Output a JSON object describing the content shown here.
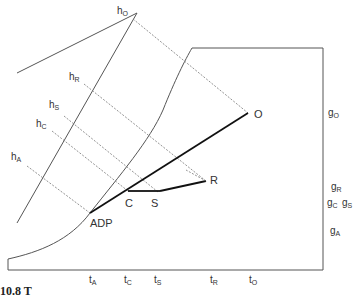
{
  "diagram": {
    "type": "psychrometric-process-diagram",
    "points": {
      "ADP": {
        "label": "ADP"
      },
      "C": {
        "label": "C"
      },
      "S": {
        "label": "S"
      },
      "R": {
        "label": "R"
      },
      "O": {
        "label": "O"
      }
    },
    "enthalpy_labels": [
      {
        "main": "h",
        "sub": "O"
      },
      {
        "main": "h",
        "sub": "R"
      },
      {
        "main": "h",
        "sub": "S"
      },
      {
        "main": "h",
        "sub": "C"
      },
      {
        "main": "h",
        "sub": "A"
      }
    ],
    "temperature_labels": [
      {
        "main": "t",
        "sub": "A"
      },
      {
        "main": "t",
        "sub": "C"
      },
      {
        "main": "t",
        "sub": "S"
      },
      {
        "main": "t",
        "sub": "R"
      },
      {
        "main": "t",
        "sub": "O"
      }
    ],
    "moisture_labels": [
      {
        "main": "g",
        "sub": "O"
      },
      {
        "main": "g",
        "sub": "R"
      },
      {
        "main": "g",
        "sub": "C"
      },
      {
        "main": "g",
        "sub": "S"
      },
      {
        "main": "g",
        "sub": "A"
      }
    ],
    "caption_fragment": "10.8   T"
  }
}
